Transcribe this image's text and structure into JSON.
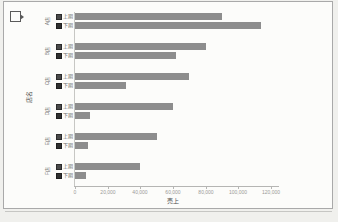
{
  "window": {
    "background": "#f0f0ed"
  },
  "icons": {
    "cursor": "selection-cursor-icon"
  },
  "chart_data": {
    "type": "bar",
    "orientation": "horizontal",
    "title": "",
    "xlabel": "売上",
    "ylabel": "店名",
    "xlim": [
      0,
      120000
    ],
    "x_ticks": [
      "0",
      "20,000",
      "40,000",
      "60,000",
      "80,000",
      "100,000",
      "120,000"
    ],
    "categories": [
      "A店",
      "B店",
      "C店",
      "D店",
      "E店",
      "F店"
    ],
    "series": [
      {
        "name": "上期",
        "values": [
          90000,
          80000,
          70000,
          60000,
          50000,
          40000
        ]
      },
      {
        "name": "下期",
        "values": [
          114000,
          62000,
          31000,
          9000,
          8000,
          7000
        ]
      }
    ],
    "grid": false,
    "legend_position": "per-row-keys",
    "bar_color": "#8d8d8d",
    "axis_text_color": "#9b9b98"
  }
}
